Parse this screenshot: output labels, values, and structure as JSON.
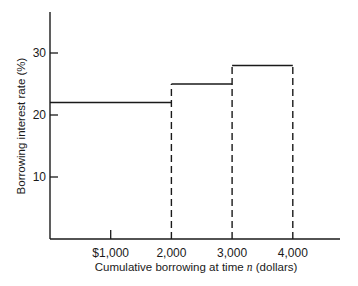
{
  "chart_data": {
    "type": "line",
    "subtype": "step",
    "title": "",
    "xlabel": "Cumulative borrowing at time n (dollars)",
    "xlabel_parts": {
      "before": "Cumulative borrowing at time ",
      "italic": "n",
      "after": " (dollars)"
    },
    "ylabel": "Borrowing interest rate (%)",
    "x_ticks": [
      {
        "value": 1000,
        "label": "$1,000"
      },
      {
        "value": 2000,
        "label": "2,000"
      },
      {
        "value": 3000,
        "label": "3,000"
      },
      {
        "value": 4000,
        "label": "4,000"
      }
    ],
    "y_ticks": [
      {
        "value": 10,
        "label": "10"
      },
      {
        "value": 20,
        "label": "20"
      },
      {
        "value": 30,
        "label": "30"
      }
    ],
    "xlim": [
      0,
      5100
    ],
    "ylim": [
      0,
      37
    ],
    "grid": false,
    "legend": null,
    "series": [
      {
        "name": "Borrowing rate",
        "segments": [
          {
            "x_start": 0,
            "x_end": 2000,
            "rate": 22
          },
          {
            "x_start": 2000,
            "x_end": 3000,
            "rate": 25
          },
          {
            "x_start": 3000,
            "x_end": 4000,
            "rate": 28
          }
        ]
      }
    ],
    "dashed_verticals": [
      2000,
      3000,
      4000
    ]
  }
}
